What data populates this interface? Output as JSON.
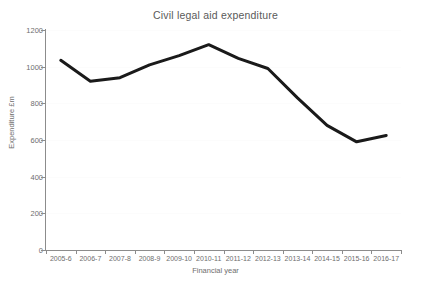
{
  "chart_data": {
    "type": "line",
    "title": "Civil legal aid expenditure",
    "xlabel": "Financial year",
    "ylabel": "Expenditure £m",
    "categories": [
      "2005-6",
      "2006-7",
      "2007-8",
      "2008-9",
      "2009-10",
      "2010-11",
      "2011-12",
      "2012-13",
      "2013-14",
      "2014-15",
      "2015-16",
      "2016-17"
    ],
    "values": [
      1035,
      920,
      940,
      1010,
      1060,
      1120,
      1045,
      990,
      830,
      680,
      590,
      625
    ],
    "series": [
      {
        "name": "Civil legal aid expenditure",
        "values": [
          1035,
          920,
          940,
          1010,
          1060,
          1120,
          1045,
          990,
          830,
          680,
          590,
          625
        ]
      }
    ],
    "ylim": [
      0,
      1200
    ],
    "yticks": [
      0,
      200,
      400,
      600,
      800,
      1000,
      1200
    ],
    "ytick_labels": [
      "0",
      "200",
      "400",
      "600",
      "800",
      "1000",
      "1200"
    ],
    "grid": true,
    "legend": false,
    "legend_position": "none",
    "line_color": "#1a1a1a",
    "line_width": 3,
    "axis_color": "#8c8c8c",
    "text_color": "#6e6e6e",
    "background": "#ffffff"
  }
}
